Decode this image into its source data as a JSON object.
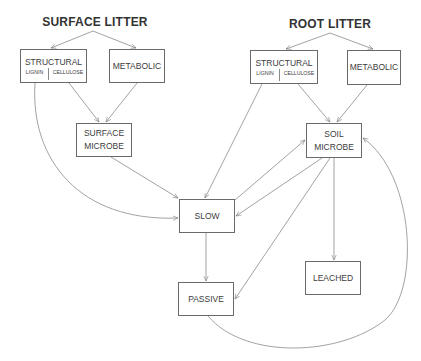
{
  "diagram": {
    "titles": {
      "surface_litter": "SURFACE LITTER",
      "root_litter": "ROOT LITTER"
    },
    "nodes": {
      "surface_structural": {
        "label": "STRUCTURAL",
        "sub_left": "LIGNIN",
        "sub_right": "CELLULOSE"
      },
      "surface_metabolic": {
        "label": "METABOLIC"
      },
      "root_structural": {
        "label": "STRUCTURAL",
        "sub_left": "LIGNIN",
        "sub_right": "CELLULOSE"
      },
      "root_metabolic": {
        "label": "METABOLIC"
      },
      "surface_microbe": {
        "label": "SURFACE\nMICROBE"
      },
      "soil_microbe": {
        "label": "SOIL\nMICROBE"
      },
      "slow": {
        "label": "SLOW"
      },
      "passive": {
        "label": "PASSIVE"
      },
      "leached": {
        "label": "LEACHED"
      }
    },
    "edges": [
      {
        "from": "SURFACE LITTER",
        "to": "surface STRUCTURAL"
      },
      {
        "from": "SURFACE LITTER",
        "to": "surface METABOLIC"
      },
      {
        "from": "ROOT LITTER",
        "to": "root STRUCTURAL"
      },
      {
        "from": "ROOT LITTER",
        "to": "root METABOLIC"
      },
      {
        "from": "surface STRUCTURAL (cellulose)",
        "to": "SURFACE MICROBE"
      },
      {
        "from": "surface METABOLIC",
        "to": "SURFACE MICROBE"
      },
      {
        "from": "surface STRUCTURAL (lignin)",
        "to": "SLOW"
      },
      {
        "from": "SURFACE MICROBE",
        "to": "SLOW"
      },
      {
        "from": "root STRUCTURAL (cellulose)",
        "to": "SOIL MICROBE"
      },
      {
        "from": "root METABOLIC",
        "to": "SOIL MICROBE"
      },
      {
        "from": "root STRUCTURAL (lignin)",
        "to": "SLOW"
      },
      {
        "from": "SLOW",
        "to": "SOIL MICROBE"
      },
      {
        "from": "SOIL MICROBE",
        "to": "SLOW"
      },
      {
        "from": "SOIL MICROBE",
        "to": "PASSIVE"
      },
      {
        "from": "SOIL MICROBE",
        "to": "LEACHED"
      },
      {
        "from": "SLOW",
        "to": "PASSIVE"
      },
      {
        "from": "PASSIVE",
        "to": "SOIL MICROBE"
      }
    ],
    "colors": {
      "line": "#7a7a7a",
      "box_border": "#6a6a6a",
      "text": "#3a3a3a"
    }
  }
}
